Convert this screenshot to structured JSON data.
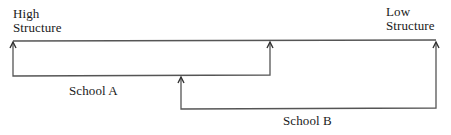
{
  "diagram": {
    "type": "structure-continuum",
    "endpoints": {
      "left": {
        "line1": "High",
        "line2": "Structure"
      },
      "right": {
        "line1": "Low",
        "line2": "Structure"
      }
    },
    "ranges": [
      {
        "label": "School A",
        "from": "High Structure",
        "to": "middle"
      },
      {
        "label": "School B",
        "from": "middle-left",
        "to": "Low Structure"
      }
    ],
    "colors": {
      "line": "#555555",
      "text": "#1a1a1a",
      "background": "#ffffff"
    }
  }
}
